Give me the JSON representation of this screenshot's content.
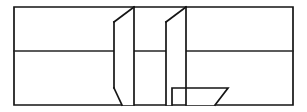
{
  "figure": {
    "title": "Perspective line drawing of folded panels",
    "kind": "line-drawing",
    "canvas": {
      "width": 307,
      "height": 112,
      "background": "#ffffff"
    },
    "stroke_color": "#151515",
    "stroke_width": 1.7,
    "frame": {
      "name": "outer-rectangle",
      "left": 14,
      "top": 7,
      "right": 293,
      "bottom": 105,
      "description": "Outer rectangular border of the drawing"
    },
    "divider": {
      "name": "horizontal-midline",
      "y": 51,
      "x_start": 14,
      "x_end": 293,
      "description": "Horizontal line splitting the rectangle into upper and lower bands"
    },
    "shapes": [
      {
        "name": "left-folded-panel",
        "label": "J-shaped folded panel",
        "points": "134,7 114,22 114,88 122,105 134,105 134,7",
        "description": "Parallelogram-like panel: diagonal fold from top edge down-left, long vertical, short bottom diagonal back to the base line"
      },
      {
        "name": "right-folded-bracket",
        "label": "L-shaped folded bracket",
        "points": "186,7 166,22 166,105 172,105 172,88 228,88 215,105 186,105 186,7",
        "description": "Bracket panel with diagonal fold at the top, vertical spine, horizontal shelf at lower band and a diagonal return to the base line"
      }
    ],
    "segments": [
      {
        "name": "frame-top",
        "from": [
          14,
          7
        ],
        "to": [
          293,
          7
        ]
      },
      {
        "name": "frame-right",
        "from": [
          293,
          7
        ],
        "to": [
          293,
          105
        ]
      },
      {
        "name": "frame-bottom",
        "from": [
          293,
          105
        ],
        "to": [
          14,
          105
        ]
      },
      {
        "name": "frame-left",
        "from": [
          14,
          105
        ],
        "to": [
          14,
          7
        ]
      },
      {
        "name": "midline",
        "from": [
          14,
          51
        ],
        "to": [
          293,
          51
        ]
      },
      {
        "name": "left-panel-top-diagonal",
        "from": [
          134,
          7
        ],
        "to": [
          114,
          22
        ]
      },
      {
        "name": "left-panel-left-edge",
        "from": [
          114,
          22
        ],
        "to": [
          114,
          88
        ]
      },
      {
        "name": "left-panel-bottom-diagonal",
        "from": [
          114,
          88
        ],
        "to": [
          122,
          105
        ]
      },
      {
        "name": "left-panel-right-edge",
        "from": [
          134,
          7
        ],
        "to": [
          134,
          105
        ]
      },
      {
        "name": "right-bracket-top-diagonal",
        "from": [
          186,
          7
        ],
        "to": [
          166,
          22
        ]
      },
      {
        "name": "right-bracket-left-edge",
        "from": [
          166,
          22
        ],
        "to": [
          166,
          105
        ]
      },
      {
        "name": "right-bracket-spine",
        "from": [
          186,
          7
        ],
        "to": [
          186,
          105
        ]
      },
      {
        "name": "right-bracket-inner-riser",
        "from": [
          172,
          105
        ],
        "to": [
          172,
          88
        ]
      },
      {
        "name": "right-bracket-shelf",
        "from": [
          172,
          88
        ],
        "to": [
          228,
          88
        ]
      },
      {
        "name": "right-bracket-return-diagonal",
        "from": [
          228,
          88
        ],
        "to": [
          215,
          105
        ]
      }
    ]
  }
}
